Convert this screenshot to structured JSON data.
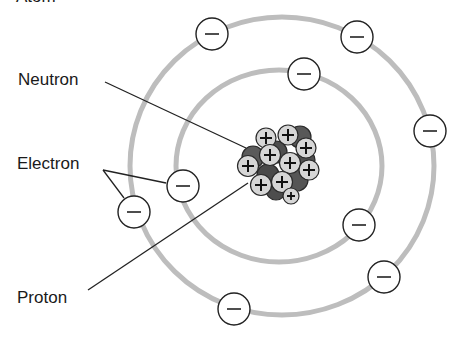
{
  "diagram": {
    "title_fragment": "Atom",
    "labels": {
      "neutron": "Neutron",
      "electron": "Electron",
      "proton": "Proton"
    },
    "symbols": {
      "electron": "−",
      "proton": "+"
    },
    "colors": {
      "orbit": "#b8b8b8",
      "neutron": "#555555",
      "proton": "#d4d4d4",
      "outline": "#222222"
    },
    "orbits": [
      {
        "name": "inner-orbit",
        "cx": 279,
        "cy": 166,
        "rx": 103,
        "ry": 96
      },
      {
        "name": "outer-orbit",
        "cx": 282,
        "cy": 166,
        "rx": 152,
        "ry": 149
      }
    ],
    "electrons": [
      {
        "x": 212,
        "y": 34
      },
      {
        "x": 357,
        "y": 37
      },
      {
        "x": 304,
        "y": 74
      },
      {
        "x": 430,
        "y": 131
      },
      {
        "x": 183,
        "y": 186
      },
      {
        "x": 134,
        "y": 212
      },
      {
        "x": 359,
        "y": 225
      },
      {
        "x": 384,
        "y": 277
      },
      {
        "x": 234,
        "y": 309
      }
    ]
  }
}
